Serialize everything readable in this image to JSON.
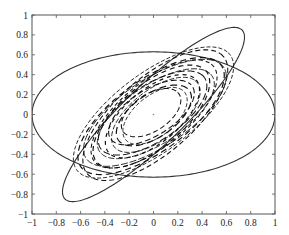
{
  "chart_data": {
    "type": "line",
    "title": "",
    "xlabel": "",
    "ylabel": "",
    "xlim": [
      -1,
      1
    ],
    "ylim": [
      -1,
      1
    ],
    "grid": false,
    "legend": null,
    "x_ticks": [
      "-1",
      "-0.8",
      "-0.6",
      "-0.4",
      "-0.2",
      "0",
      "0.2",
      "0.4",
      "0.6",
      "0.8",
      "1"
    ],
    "y_ticks": [
      "1",
      "0.8",
      "0.6",
      "0.4",
      "0.2",
      "0",
      "-0.2",
      "-0.4",
      "-0.6",
      "-0.8",
      "-1"
    ],
    "series": [
      {
        "name": "horizontal-ellipse",
        "style": "solid",
        "shape": "ellipse",
        "center": [
          0,
          0
        ],
        "semi_axis_x": 1.0,
        "semi_axis_y": 0.63,
        "rotation_deg": 0
      },
      {
        "name": "tilted-ellipse",
        "style": "solid",
        "shape": "ellipse",
        "center": [
          0,
          0
        ],
        "extreme_points": [
          [
            0.6,
            0.87
          ],
          [
            -0.6,
            -0.87
          ],
          [
            0.67,
            0.55
          ],
          [
            -0.67,
            -0.55
          ]
        ],
        "semi_major": 1.12,
        "semi_minor": 0.27,
        "rotation_deg": 50
      },
      {
        "name": "dashed-trajectories",
        "style": "dashed",
        "shape": "nested tilted ellipses (spiral), confined to intersection of both ellipses",
        "center": [
          0,
          0
        ],
        "outer_extent_x": [
          -0.6,
          0.6
        ],
        "outer_extent_y": [
          -0.62,
          0.6
        ],
        "inner_hole_semi_major": 0.3,
        "inner_hole_semi_minor": 0.17,
        "rotation_deg": 45
      }
    ],
    "annotations": [
      {
        "type": "point",
        "x": 0,
        "y": 0
      }
    ]
  }
}
